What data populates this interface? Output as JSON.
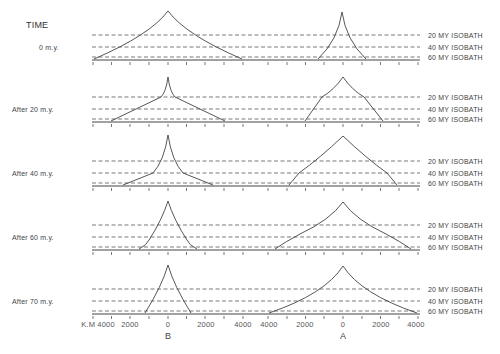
{
  "title": "TIME",
  "isobath_labels": [
    "20 MY  ISOBATH",
    "40 MY  ISOBATH",
    "60 MY  ISOBATH"
  ],
  "axis": {
    "unit_label": "K.M 4000",
    "B_ticks": [
      "2000",
      "0",
      "2000",
      "4000"
    ],
    "A_ticks": [
      "4000",
      "2000",
      "0",
      "2000",
      "4000"
    ],
    "B_label": "B",
    "A_label": "A"
  },
  "panels": [
    {
      "label": "0 m.y.",
      "baseline_y": 60
    },
    {
      "label": "After  20 m.y.",
      "baseline_y": 122
    },
    {
      "label": "After  40 m.y.",
      "baseline_y": 186
    },
    {
      "label": "After  60 m.y.",
      "baseline_y": 250
    },
    {
      "label": "After  70 m.y.",
      "baseline_y": 314
    }
  ],
  "colors": {
    "line": "#444444",
    "dash": "#555555",
    "text": "#444444"
  }
}
